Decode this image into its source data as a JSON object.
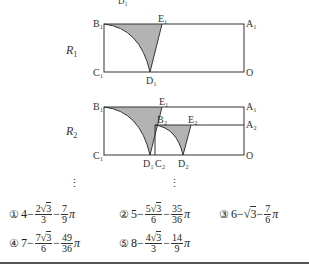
{
  "figure": {
    "top_cut_label": "D₁",
    "R1": {
      "label": "R",
      "sub": "1",
      "points": {
        "B1": "B₁",
        "E1": "E₁",
        "A1": "A₁",
        "C1": "C₁",
        "D1": "D₁",
        "O": "O"
      }
    },
    "R2": {
      "label": "R",
      "sub": "2",
      "points": {
        "B1": "B₁",
        "E1": "E₁",
        "A1": "A₁",
        "B2": "B₂",
        "E2": "E₂",
        "A2": "A₂",
        "C1": "C₁",
        "D1": "D₁",
        "C2": "C₂",
        "D2": "D₂",
        "O": "O"
      }
    },
    "shade_color": "#b3b3b3",
    "line_color": "#333333"
  },
  "choices": [
    {
      "mark": "①",
      "a": "4",
      "f1_num_coef": "2",
      "f1_num_rad": "3",
      "f1_den": "3",
      "f2_num": "7",
      "f2_den": "9"
    },
    {
      "mark": "②",
      "a": "5",
      "f1_num_coef": "5",
      "f1_num_rad": "3",
      "f1_den": "6",
      "f2_num": "35",
      "f2_den": "36"
    },
    {
      "mark": "③",
      "a": "6",
      "sqrt_term": "3",
      "f2_num": "7",
      "f2_den": "6"
    },
    {
      "mark": "④",
      "a": "7",
      "f1_num_coef": "7",
      "f1_num_rad": "3",
      "f1_den": "6",
      "f2_num": "49",
      "f2_den": "36"
    },
    {
      "mark": "⑤",
      "a": "8",
      "f1_num_coef": "4",
      "f1_num_rad": "3",
      "f1_den": "3",
      "f2_num": "14",
      "f2_den": "9"
    }
  ],
  "symbols": {
    "minus": "−",
    "pi": "π",
    "sqrt": "√",
    "vdots": "⋮"
  }
}
